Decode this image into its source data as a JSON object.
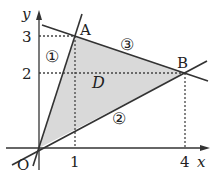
{
  "diagram": {
    "axes": {
      "x_label": "x",
      "y_label": "y",
      "origin_label": "O",
      "x_ticks": [
        "1",
        "4"
      ],
      "y_ticks": [
        "2",
        "3"
      ]
    },
    "points": {
      "A": {
        "label": "A",
        "coords": [
          1,
          3
        ]
      },
      "B": {
        "label": "B",
        "coords": [
          4,
          2
        ]
      },
      "O": {
        "label": "O",
        "coords": [
          0,
          0
        ]
      }
    },
    "lines": [
      {
        "label": "①",
        "through": [
          "O",
          "A"
        ]
      },
      {
        "label": "②",
        "through": [
          "O",
          "B"
        ]
      },
      {
        "label": "③",
        "through": [
          "A",
          "B"
        ]
      }
    ],
    "region": {
      "label": "D",
      "fill": "#d9d9d9"
    },
    "colors": {
      "line": "#333333",
      "axis": "#333333",
      "dash": "#444444"
    }
  }
}
